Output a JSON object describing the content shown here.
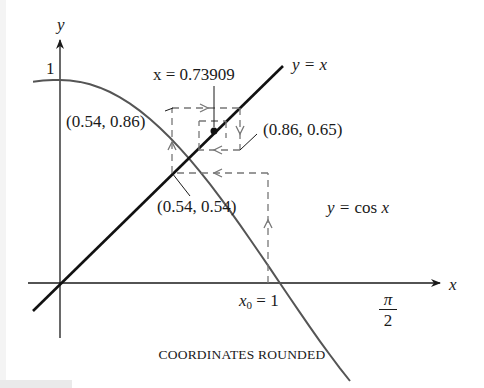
{
  "diagram": {
    "axes": {
      "x_label": "x",
      "y_label": "y",
      "y_tick_label": "1",
      "x_tick_x0_var": "x",
      "x_tick_x0_sub": "0",
      "x_tick_x0_rest": " = 1",
      "x_tick_pi_num": "π",
      "x_tick_pi_den": "2"
    },
    "curves": {
      "cos_label_prefix": "y = ",
      "cos_label_fn": "cos ",
      "cos_label_var": "x",
      "identity_label": "y = x"
    },
    "fixed_point_label": "x = 0.73909",
    "points": [
      {
        "label": "(0.54, 0.86)",
        "x": 0.54,
        "y": 0.86
      },
      {
        "label": "(0.86, 0.65)",
        "x": 0.86,
        "y": 0.65
      },
      {
        "label": "(0.54, 0.54)",
        "x": 0.54,
        "y": 0.54
      }
    ],
    "start_x0": 1,
    "fixed_point": 0.73909,
    "caption": "COORDINATES ROUNDED",
    "colors": {
      "axes": "#1a1a1a",
      "identity_line": "#111111",
      "cos_curve": "#555555",
      "dashed_path": "#777777",
      "text": "#1a1a1a"
    }
  }
}
